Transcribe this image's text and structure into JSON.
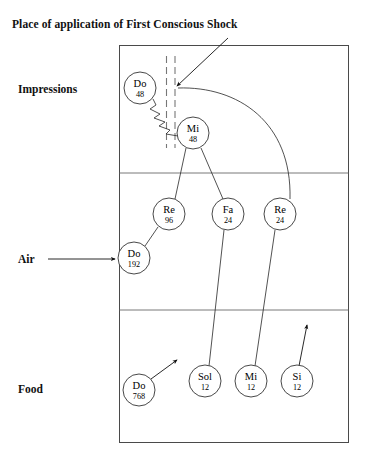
{
  "diagram": {
    "title": "Place of application of First Conscious Shock",
    "rows": [
      {
        "id": "impressions",
        "label": "Impressions",
        "has_inlet_arrow": false
      },
      {
        "id": "air",
        "label": "Air",
        "has_inlet_arrow": true
      },
      {
        "id": "food",
        "label": "Food",
        "has_inlet_arrow": false
      }
    ],
    "notes": [
      {
        "id": "impressions-do-48",
        "name": "Do",
        "value": "48",
        "row": "impressions",
        "cx": 140,
        "cy": 88,
        "r": 16
      },
      {
        "id": "impressions-mi-48",
        "name": "Mi",
        "value": "48",
        "row": "impressions",
        "cx": 193,
        "cy": 133,
        "r": 16
      },
      {
        "id": "air-re-96",
        "name": "Re",
        "value": "96",
        "row": "air",
        "cx": 169,
        "cy": 214,
        "r": 16
      },
      {
        "id": "air-fa-24",
        "name": "Fa",
        "value": "24",
        "row": "air",
        "cx": 228,
        "cy": 214,
        "r": 16
      },
      {
        "id": "air-re-24",
        "name": "Re",
        "value": "24",
        "row": "air",
        "cx": 280,
        "cy": 214,
        "r": 16
      },
      {
        "id": "air-do-192",
        "name": "Do",
        "value": "192",
        "row": "air",
        "cx": 134,
        "cy": 258,
        "r": 16
      },
      {
        "id": "food-do-768",
        "name": "Do",
        "value": "768",
        "row": "food",
        "cx": 139,
        "cy": 390,
        "r": 16
      },
      {
        "id": "food-sol-12",
        "name": "Sol",
        "value": "12",
        "row": "food",
        "cx": 205,
        "cy": 381,
        "r": 16
      },
      {
        "id": "food-mi-12",
        "name": "Mi",
        "value": "12",
        "row": "food",
        "cx": 251,
        "cy": 381,
        "r": 16
      },
      {
        "id": "food-si-12",
        "name": "Si",
        "value": "12",
        "row": "food",
        "cx": 297,
        "cy": 381,
        "r": 16
      }
    ],
    "colors": {
      "frame": "#4a4a4a",
      "divider": "#6a6a6a",
      "connector": "#333333",
      "dashed_shock_line": "#777777",
      "text": "#111111",
      "background": "#ffffff"
    },
    "frame": {
      "x": 119,
      "y": 45,
      "width": 230,
      "height": 398
    },
    "dividers_y": [
      173,
      310
    ],
    "shock_marker": {
      "type": "double-dashed-vertical",
      "x1": 166,
      "x2": 175,
      "top": 56,
      "bottom": 148
    }
  }
}
